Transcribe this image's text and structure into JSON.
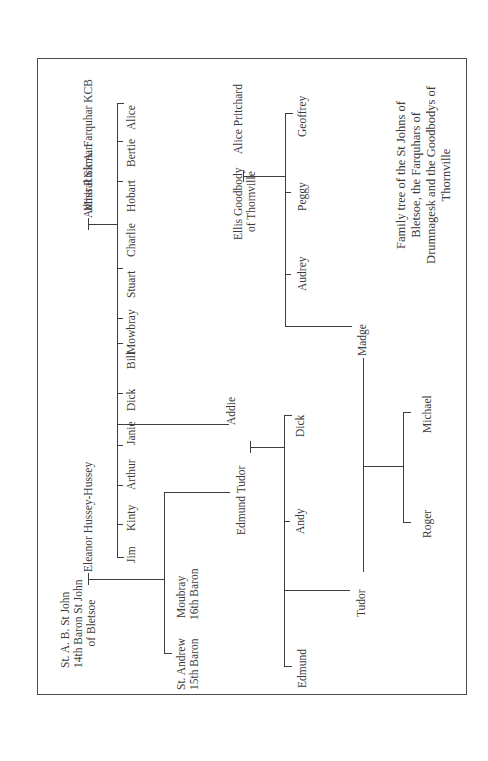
{
  "diagram": {
    "type": "family-tree",
    "orientation": "rotated-90-ccw",
    "title": [
      "Family tree of the St Johns of",
      "Bletsoe, the Farquhars of",
      "Drumnagesk and the Goodbodys of",
      "Thornville"
    ],
    "farquhar": {
      "father": "Admiral Sir A. Farquhar KCB",
      "mother": "Miss Rickman",
      "children": [
        "Alice",
        "Bertie",
        "Hobart",
        "Charlie",
        "Stuart",
        "Mowbray",
        "Bill",
        "Dick",
        "Addie"
      ]
    },
    "st_john": {
      "father": [
        "St. A. B. St John",
        "14th Baron St John",
        "of Bletsoe"
      ],
      "mother": "Eleanor Hussey-Hussey",
      "children": [
        "Janie",
        "Arthur",
        "Kinty",
        "Jim",
        "Edmund Tudor"
      ],
      "sons_barons": [
        [
          "Moubray",
          "16th Baron"
        ],
        [
          "St. Andrew",
          "15th Baron"
        ]
      ]
    },
    "tudor": {
      "father": "Edmund Tudor",
      "mother": "Addie",
      "children": [
        "Dick",
        "Andy",
        "Tudor",
        "Edmund"
      ]
    },
    "goodbody": {
      "father": [
        "Ellis Goodbody",
        "of Thornville"
      ],
      "mother": "Alice Pritchard",
      "children": [
        "Geoffrey",
        "Peggy",
        "Audrey",
        "Madge"
      ]
    },
    "tudor_madge": {
      "husband": "Tudor",
      "wife": "Madge",
      "children": [
        "Michael",
        "Roger"
      ]
    }
  }
}
